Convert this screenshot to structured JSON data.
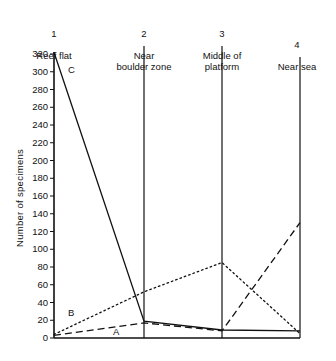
{
  "chart_data": {
    "type": "line",
    "title": "",
    "xlabel": "",
    "ylabel": "Number of specimens",
    "ylim": [
      0,
      330
    ],
    "grid": false,
    "legend_position": "inline-annotations",
    "categories": [
      "Reef flat",
      "Near boulder zone",
      "Middle of platform",
      "Near sea"
    ],
    "category_numbers": [
      "1",
      "2",
      "3",
      "4"
    ],
    "ytick_labels": [
      "320",
      "300",
      "280",
      "260",
      "240",
      "220",
      "200",
      "180",
      "160",
      "140",
      "120",
      "100",
      "80",
      "60",
      "40",
      "20",
      "0"
    ],
    "ytick_values": [
      320,
      300,
      280,
      260,
      240,
      220,
      200,
      180,
      160,
      140,
      120,
      100,
      80,
      60,
      40,
      20,
      0
    ],
    "series": [
      {
        "name": "A",
        "style": "dashed",
        "label": "A",
        "values": [
          3,
          17,
          8,
          130
        ]
      },
      {
        "name": "B",
        "style": "dotted",
        "label": "B",
        "values": [
          4,
          52,
          85,
          5
        ]
      },
      {
        "name": "C",
        "style": "solid",
        "label": "C",
        "values": [
          322,
          19,
          9,
          8
        ]
      }
    ]
  },
  "axis": {
    "y_axis_title": "Number of specimens"
  },
  "colors": {
    "ink": "#111111",
    "background": "#ffffff"
  },
  "columns": [
    {
      "number": "1",
      "caption": "Reef flat"
    },
    {
      "number": "2",
      "caption": "Near\nboulder zone"
    },
    {
      "number": "3",
      "caption": "Middle of\nplatform"
    },
    {
      "number": "4",
      "caption": "Near sea"
    }
  ],
  "curve_labels": {
    "a": "A",
    "b": "B",
    "c": "C"
  }
}
